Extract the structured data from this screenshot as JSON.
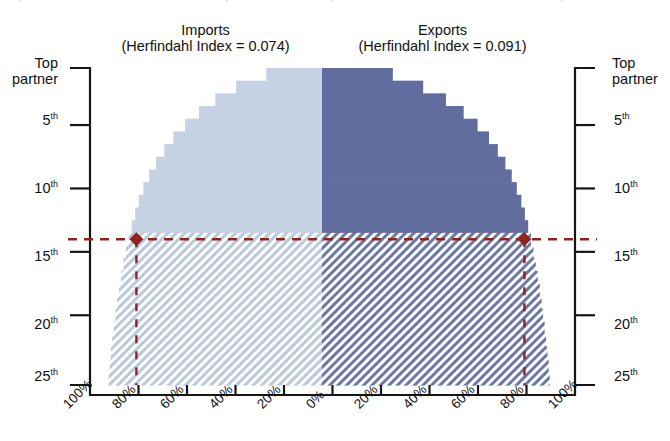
{
  "chart_data": {
    "type": "bar",
    "subtype": "mirrored-horizontal-cumulative-step",
    "title": "",
    "panels": [
      {
        "name": "imports",
        "label": "Imports",
        "index_label": "(Herfindahl Index = 0.074)",
        "index_name": "Herfindahl Index",
        "index_value": 0.074,
        "side": "left",
        "color": "#c5d2e3",
        "hatch_color": "#ccd6e4",
        "xlabel": "",
        "tick_labels": [
          "100%",
          "80%",
          "60%",
          "40%",
          "20%",
          "0%"
        ],
        "xlim": [
          100,
          0
        ],
        "values": [
          24,
          37,
          46,
          53,
          59,
          64,
          68,
          71.5,
          74.5,
          77,
          79,
          80.5,
          82,
          83.3,
          84.5,
          85.6,
          86.6,
          87.5,
          88.3,
          89.1,
          89.8,
          90.4,
          91.0,
          91.5,
          92.0
        ],
        "solid_rows": 13
      },
      {
        "name": "exports",
        "label": "Exports",
        "index_label": "(Herfindahl Index = 0.091)",
        "index_name": "Herfindahl Index",
        "index_value": 0.091,
        "side": "right",
        "color": "#616d9e",
        "hatch_color": "#6f7aa6",
        "xlabel": "",
        "tick_labels": [
          "0%",
          "20%",
          "40%",
          "60%",
          "80%",
          "100%"
        ],
        "xlim": [
          0,
          100
        ],
        "values": [
          28,
          40,
          49,
          56,
          61.5,
          66,
          69.5,
          72.5,
          75,
          77,
          78.8,
          80.2,
          81.5,
          82.6,
          83.6,
          84.5,
          85.3,
          86.1,
          86.8,
          87.4,
          88.0,
          88.6,
          89.1,
          89.6,
          90.0
        ],
        "solid_rows": 13
      }
    ],
    "categories": [
      "Top partner",
      "2nd",
      "3rd",
      "4th",
      "5th",
      "6th",
      "7th",
      "8th",
      "9th",
      "10th",
      "11th",
      "12th",
      "13th",
      "14th",
      "15th",
      "16th",
      "17th",
      "18th",
      "19th",
      "20th",
      "21st",
      "22nd",
      "23rd",
      "24th",
      "25th"
    ],
    "ylabel": "",
    "ylim": [
      1,
      25
    ],
    "y_tick_labels": [
      "Top partner",
      "5th",
      "10th",
      "15th",
      "20th",
      "25th"
    ],
    "y_tick_ranks": [
      1,
      5,
      10,
      15,
      20,
      25
    ],
    "grid": false,
    "legend": "none",
    "annotations": {
      "reference_line_rank": 13.5,
      "reference_line_color": "#8d2420",
      "reference_line_style": "dashed",
      "marker_shape": "diamond",
      "marker_color": "#8d2420",
      "marker_left_value": 80,
      "marker_right_value": 80,
      "hatched_region_note": "ranks 14-25 shown with diagonal hatch fill"
    }
  },
  "axes": {
    "left": {
      "ticks": [
        {
          "rank": 1,
          "label_line1": "Top",
          "label_line2": "partner"
        },
        {
          "rank": 5,
          "label": "5",
          "sup": "th"
        },
        {
          "rank": 10,
          "label": "10",
          "sup": "th"
        },
        {
          "rank": 15,
          "label": "15",
          "sup": "th"
        },
        {
          "rank": 20,
          "label": "20",
          "sup": "th"
        },
        {
          "rank": 25,
          "label": "25",
          "sup": "th"
        }
      ]
    },
    "right": {
      "ticks": [
        {
          "rank": 1,
          "label_line1": "Top",
          "label_line2": "partner"
        },
        {
          "rank": 5,
          "label": "5",
          "sup": "th"
        },
        {
          "rank": 10,
          "label": "10",
          "sup": "th"
        },
        {
          "rank": 15,
          "label": "15",
          "sup": "th"
        },
        {
          "rank": 20,
          "label": "20",
          "sup": "th"
        },
        {
          "rank": 25,
          "label": "25",
          "sup": "th"
        }
      ]
    },
    "bottom": {
      "labels": [
        "100%",
        "80%",
        "60%",
        "40%",
        "20%",
        "0%",
        "20%",
        "40%",
        "60%",
        "80%",
        "100%"
      ]
    }
  },
  "titles": {
    "imports_line1": "Imports",
    "imports_line2": "(Herfindahl Index = 0.074)",
    "exports_line1": "Exports",
    "exports_line2": "(Herfindahl Index = 0.091)"
  },
  "colors": {
    "imports_fill": "#c5d2e3",
    "exports_fill": "#616d9e",
    "imports_hatch": "#b9c8dc",
    "exports_hatch": "#6c78a4",
    "accent_dashed": "#8d2420",
    "axis": "#161616"
  }
}
